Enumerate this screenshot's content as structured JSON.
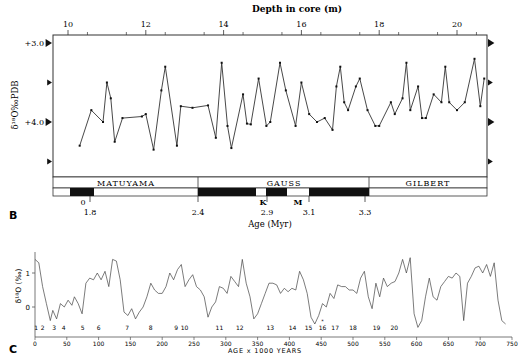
{
  "panel_b": {
    "label": "B",
    "top_axis_title": "Depth in core (m)",
    "y_axis_title": "δ¹⁸O‰PDB",
    "y_tick_labels": [
      "+3.0",
      "+4.0"
    ],
    "depth_ticks": [
      "10",
      "12",
      "14",
      "16",
      "18",
      "20"
    ],
    "chrons": [
      "MATUYAMA",
      "GAUSS",
      "GILBERT"
    ],
    "events": {
      "K": "K",
      "M": "M",
      "O": "0"
    },
    "age_ticks": [
      "1.8",
      "2.4",
      "2.9",
      "3.1",
      "3.3"
    ],
    "x_axis_title": "Age (Myr)"
  },
  "panel_c": {
    "label": "C",
    "y_axis_title": "δ¹⁸O (‰)",
    "y_tick_labels": [
      "1",
      "0"
    ],
    "x_ticks": [
      "0",
      "50",
      "100",
      "150",
      "200",
      "250",
      "300",
      "350",
      "400",
      "450",
      "500",
      "550",
      "600",
      "650",
      "700",
      "750"
    ],
    "stage_labels": [
      "1",
      "2",
      "3",
      "4",
      "5",
      "6",
      "7",
      "8",
      "9",
      "10",
      "11",
      "12",
      "13",
      "14",
      "15",
      "16",
      "17",
      "18",
      "19",
      "20"
    ],
    "x_axis_title": "AGE x 1000 YEARS"
  },
  "chart_data": [
    {
      "type": "line",
      "title": "Panel B: benthic δ18O vs depth in core",
      "xlabel": "Depth in core (m)",
      "ylabel": "δ18O ‰ PDB",
      "xlim": [
        9.6,
        20.8
      ],
      "ylim": [
        4.5,
        2.9
      ],
      "y_inverted": true,
      "x": [
        10.3,
        10.6,
        10.9,
        11.0,
        11.1,
        11.2,
        11.4,
        11.9,
        12.0,
        12.2,
        12.4,
        12.5,
        12.8,
        12.9,
        13.2,
        13.6,
        13.8,
        13.95,
        14.1,
        14.2,
        14.5,
        14.6,
        14.7,
        14.9,
        15.1,
        15.2,
        15.45,
        15.6,
        15.85,
        16.0,
        16.2,
        16.4,
        16.6,
        16.8,
        16.9,
        17.0,
        17.1,
        17.2,
        17.4,
        17.5,
        17.7,
        17.9,
        18.0,
        18.3,
        18.4,
        18.6,
        18.7,
        18.8,
        19.0,
        19.1,
        19.2,
        19.4,
        19.6,
        19.7,
        19.8,
        20.0,
        20.2,
        20.45,
        20.6,
        20.7
      ],
      "y": [
        4.3,
        3.85,
        4.0,
        3.5,
        3.7,
        4.25,
        3.95,
        3.93,
        3.9,
        4.35,
        3.6,
        3.3,
        4.3,
        3.8,
        3.82,
        3.79,
        4.2,
        3.25,
        4.05,
        4.33,
        3.65,
        4.02,
        4.03,
        3.45,
        4.05,
        4.0,
        3.25,
        3.6,
        4.05,
        3.5,
        3.9,
        4.0,
        3.95,
        4.1,
        3.55,
        3.3,
        3.75,
        3.85,
        3.55,
        3.45,
        3.85,
        4.05,
        4.05,
        3.75,
        3.9,
        3.7,
        3.25,
        3.85,
        3.55,
        3.95,
        3.95,
        3.65,
        3.75,
        3.3,
        3.75,
        3.85,
        3.75,
        3.2,
        3.8,
        3.45
      ],
      "secondary_x_axis": {
        "label": "Age (Myr)",
        "ticks": [
          1.8,
          2.4,
          2.9,
          3.1,
          3.3
        ]
      },
      "magnetostratigraphy": [
        {
          "chron": "MATUYAMA",
          "age_range": [
            1.6,
            2.4
          ]
        },
        {
          "chron": "GAUSS",
          "age_range": [
            2.4,
            3.3
          ]
        },
        {
          "chron": "GILBERT",
          "age_range": [
            3.3,
            3.7
          ]
        }
      ]
    },
    {
      "type": "line",
      "title": "Panel C: δ18O record over last 750 kyr",
      "xlabel": "AGE x 1000 YEARS",
      "ylabel": "δ18O (‰)",
      "xlim": [
        0,
        750
      ],
      "ylim": [
        -0.8,
        1.6
      ],
      "x": [
        0,
        6,
        12,
        18,
        24,
        28,
        34,
        40,
        46,
        52,
        58,
        62,
        68,
        74,
        80,
        86,
        92,
        98,
        104,
        110,
        116,
        122,
        128,
        134,
        140,
        146,
        152,
        158,
        164,
        170,
        176,
        182,
        188,
        194,
        200,
        206,
        212,
        218,
        224,
        230,
        236,
        242,
        248,
        254,
        260,
        266,
        272,
        278,
        284,
        290,
        296,
        302,
        308,
        314,
        320,
        326,
        332,
        338,
        344,
        350,
        356,
        362,
        368,
        374,
        380,
        386,
        392,
        398,
        404,
        410,
        416,
        422,
        428,
        434,
        440,
        446,
        452,
        458,
        464,
        470,
        476,
        482,
        488,
        494,
        500,
        506,
        512,
        518,
        524,
        530,
        536,
        542,
        548,
        554,
        560,
        566,
        572,
        578,
        584,
        590,
        596,
        602,
        608,
        614,
        620,
        626,
        632,
        638,
        644,
        650,
        656,
        662,
        668,
        674,
        680,
        686,
        692,
        698,
        704,
        710,
        716,
        722,
        728,
        734,
        740
      ],
      "y": [
        1.4,
        1.3,
        0.6,
        0.1,
        -0.4,
        -0.1,
        -0.35,
        0.1,
        0.0,
        0.2,
        0.05,
        0.3,
        0.1,
        -0.2,
        0.7,
        0.85,
        0.8,
        1.0,
        0.8,
        1.05,
        0.6,
        1.4,
        1.35,
        0.8,
        -0.15,
        -0.25,
        -0.05,
        -0.35,
        -0.15,
        0.0,
        0.3,
        0.7,
        0.5,
        0.4,
        0.4,
        0.6,
        1.0,
        0.8,
        1.1,
        1.25,
        0.6,
        0.8,
        0.95,
        0.6,
        0.5,
        0.3,
        -0.3,
        0.0,
        0.15,
        0.6,
        0.55,
        0.4,
        0.9,
        0.75,
        0.6,
        1.4,
        0.7,
        0.3,
        -0.35,
        -0.2,
        0.1,
        0.4,
        0.7,
        0.7,
        0.65,
        0.4,
        0.55,
        0.45,
        0.55,
        0.5,
        1.05,
        0.8,
        0.4,
        -0.3,
        -0.5,
        -0.25,
        0.1,
        0.0,
        0.4,
        0.25,
        0.65,
        0.6,
        0.6,
        0.5,
        0.5,
        0.4,
        0.85,
        1.05,
        0.3,
        -0.05,
        0.7,
        0.3,
        0.85,
        0.6,
        0.7,
        0.75,
        1.0,
        1.4,
        1.0,
        1.45,
        -0.2,
        -0.6,
        -0.4,
        0.3,
        0.85,
        0.3,
        0.2,
        0.6,
        0.75,
        0.9,
        0.85,
        1.0,
        0.9,
        -0.4,
        0.7,
        0.9,
        1.15,
        1.2,
        1.0,
        1.25,
        0.9,
        1.3,
        0.2,
        -0.4,
        -0.5,
        -0.35,
        -0.3,
        -0.1
      ]
    }
  ]
}
